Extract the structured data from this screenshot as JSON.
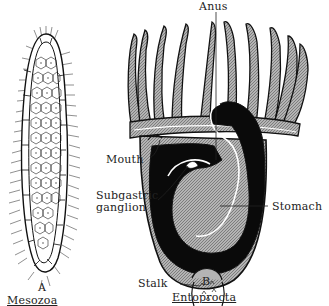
{
  "figure": {
    "panels": [
      {
        "id": "A",
        "letter": "A",
        "caption": "Mesozoa",
        "description": "Elongated ciliated organism with outer layer of rectangular cells surrounding inner polygonal cells"
      },
      {
        "id": "B",
        "letter": "B",
        "caption": "Entoprocta",
        "description": "Cup-shaped body with crown of tentacles, U-shaped gut, on a stalk",
        "labels": {
          "anus": "Anus",
          "mouth": "Mouth",
          "ganglion_line1": "Subgastric",
          "ganglion_line2": "ganglion",
          "stomach": "Stomach",
          "stalk": "Stalk"
        }
      }
    ],
    "colors": {
      "ink": "#1a1a1a",
      "shade": "#9a9a9a",
      "dark": "#0a0a0a",
      "background": "#ffffff"
    }
  }
}
